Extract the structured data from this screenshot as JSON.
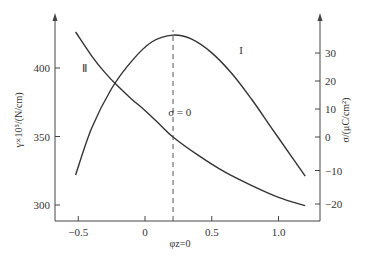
{
  "chart_data": {
    "type": "line",
    "title": "",
    "xlabel": "φz=0",
    "ylabel": "γ×10⁵/(N/cm)",
    "y2label": "σ/(μC/cm²)",
    "xlim": [
      -0.62,
      1.3
    ],
    "ylim": [
      290,
      440
    ],
    "y2lim": [
      -24,
      40
    ],
    "x_ticks": [
      -0.5,
      0,
      0.5,
      1.0
    ],
    "x_tick_labels": [
      "−0.5",
      "0",
      "0.5",
      "1.0"
    ],
    "y_ticks": [
      300,
      350,
      400
    ],
    "y_tick_labels": [
      "300",
      "350",
      "400"
    ],
    "y2_ticks": [
      -20,
      -10,
      0,
      10,
      20,
      30
    ],
    "y2_tick_labels": [
      "−20",
      "−10",
      "0",
      "10",
      "20",
      "30"
    ],
    "grid": false,
    "series": [
      {
        "name": "I",
        "axis": "left",
        "description": "Electrocapillary curve γ vs φ (parabola, max at σ=0)",
        "x": [
          -0.52,
          -0.4,
          -0.25,
          -0.1,
          0.05,
          0.21,
          0.35,
          0.5,
          0.65,
          0.8,
          0.95,
          1.1,
          1.2
        ],
        "values": [
          322,
          356,
          385,
          405,
          419,
          424,
          421,
          411,
          396,
          377,
          356,
          335,
          321
        ]
      },
      {
        "name": "II",
        "axis": "right",
        "description": "Surface charge density σ vs φ",
        "x": [
          -0.52,
          -0.4,
          -0.3,
          -0.2,
          -0.1,
          0,
          0.1,
          0.21,
          0.4,
          0.6,
          0.8,
          1.0,
          1.2
        ],
        "values": [
          37.5,
          29,
          23,
          18,
          13.5,
          9.5,
          5,
          0,
          -5.5,
          -10.5,
          -14.5,
          -18,
          -20.5
        ]
      }
    ],
    "annotations": [
      {
        "text": "I",
        "x": 0.72,
        "y": 410
      },
      {
        "text": "Ⅱ",
        "x": -0.45,
        "y": 397
      },
      {
        "text": "σ = 0",
        "x": 0.26,
        "y": 365
      },
      {
        "type": "vline",
        "x": 0.21,
        "style": "dashed"
      }
    ]
  }
}
